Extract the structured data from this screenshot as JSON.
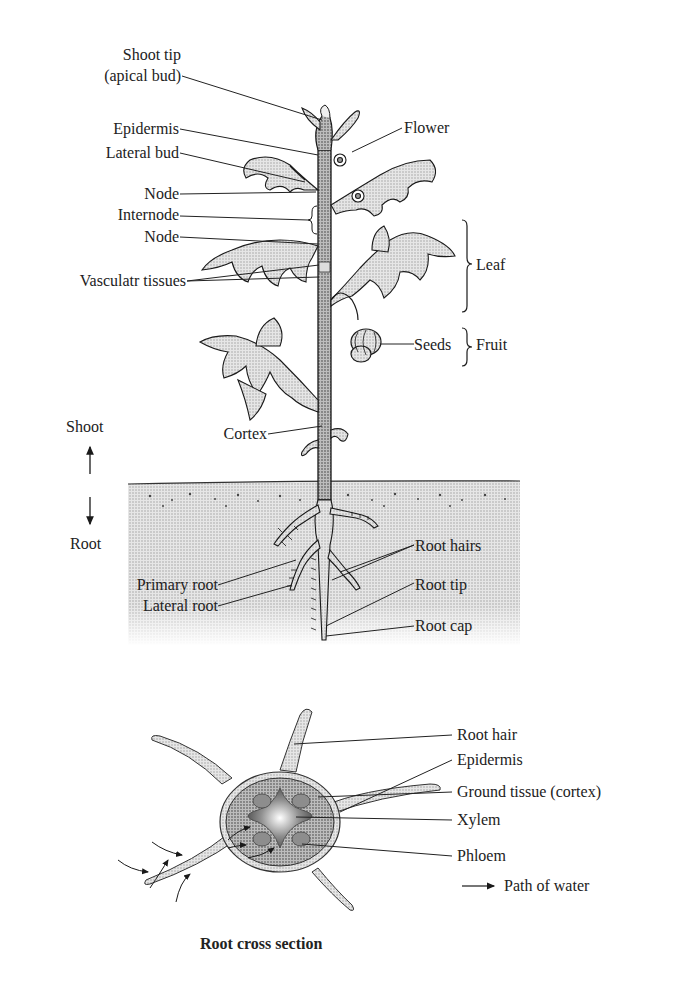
{
  "plant": {
    "left_labels": {
      "shoot_tip_1": "Shoot tip",
      "shoot_tip_2": "(apical bud)",
      "epidermis": "Epidermis",
      "lateral_bud": "Lateral bud",
      "node_upper": "Node",
      "internode": "Internode",
      "node_lower": "Node",
      "vascular_tissues": "Vasculatr tissues",
      "cortex": "Cortex",
      "primary_root": "Primary root",
      "lateral_root": "Lateral root"
    },
    "right_labels": {
      "flower": "Flower",
      "leaf": "Leaf",
      "seeds": "Seeds",
      "fruit": "Fruit",
      "root_hairs": "Root hairs",
      "root_tip": "Root tip",
      "root_cap": "Root cap"
    },
    "orientation": {
      "shoot": "Shoot",
      "root": "Root"
    }
  },
  "cross_section": {
    "title": "Root cross section",
    "labels": {
      "root_hair": "Root hair",
      "epidermis": "Epidermis",
      "ground_tissue": "Ground tissue (cortex)",
      "xylem": "Xylem",
      "phloem": "Phloem"
    },
    "legend": {
      "path_of_water": "Path of water"
    }
  },
  "colors": {
    "ink": "#1a1a1a",
    "stipple_light": "#d9d9d9",
    "stipple_mid": "#b5b5b5",
    "stipple_dark": "#8a8a8a"
  }
}
